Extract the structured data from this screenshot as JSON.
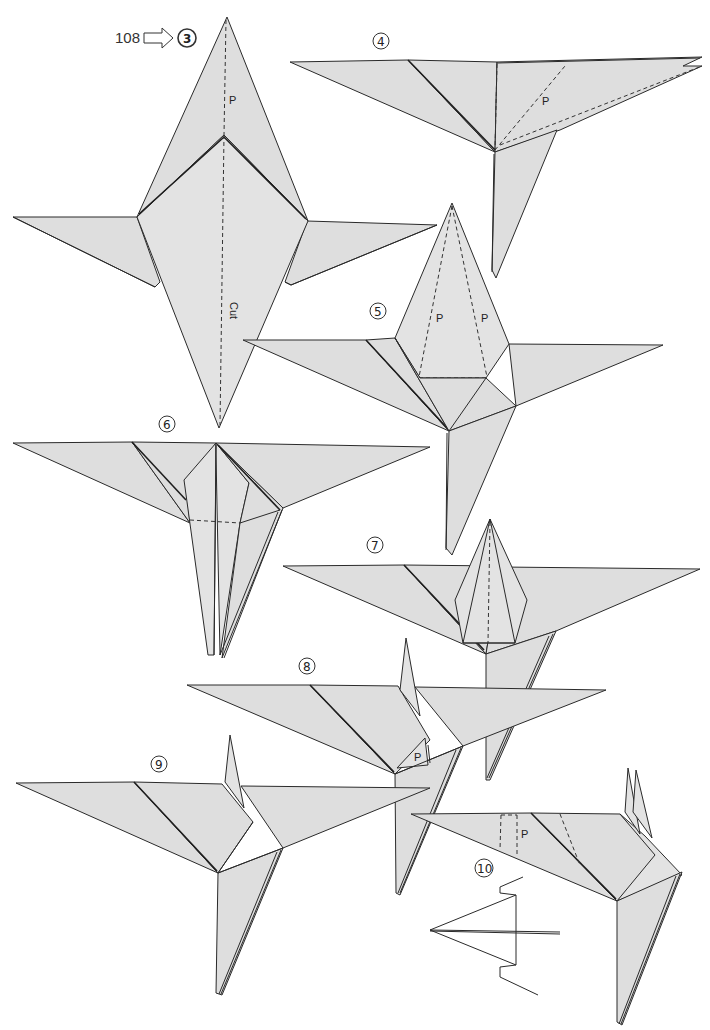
{
  "page": {
    "background": "#ffffff",
    "paper_color": "#dedede",
    "line_color": "#2a2a2a"
  },
  "header": {
    "reference_page": "108",
    "arrow_icon": "outline-right-arrow",
    "start_step": "3"
  },
  "steps": [
    {
      "id": "3",
      "label": "3",
      "annotations": [
        "P",
        "Cut"
      ]
    },
    {
      "id": "4",
      "label": "4",
      "annotations": [
        "P"
      ]
    },
    {
      "id": "5",
      "label": "5",
      "annotations": [
        "P",
        "P"
      ]
    },
    {
      "id": "6",
      "label": "6",
      "annotations": []
    },
    {
      "id": "7",
      "label": "7",
      "annotations": []
    },
    {
      "id": "8",
      "label": "8",
      "annotations": [
        "P"
      ]
    },
    {
      "id": "9",
      "label": "9",
      "annotations": []
    },
    {
      "id": "10",
      "label": "10",
      "annotations": [
        "P"
      ],
      "inset": "side-view-fold-diagram"
    }
  ],
  "labels": {
    "s3_p": "P",
    "s3_cut": "Cut",
    "s4_p": "P",
    "s5_p_left": "P",
    "s5_p_right": "P",
    "s8_p": "P",
    "s10_p": "P"
  }
}
